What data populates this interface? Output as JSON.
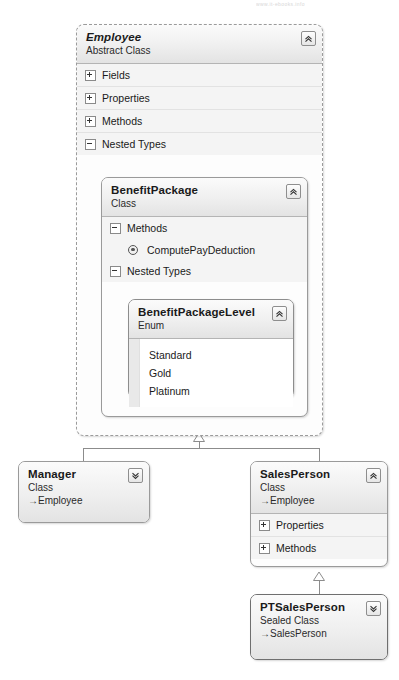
{
  "diagram": {
    "watermark": "www.it-ebooks.info",
    "type": "uml-class-diagram",
    "accent_border": "#9a9a9a",
    "header_gradient_top": "#fbfbfb",
    "header_gradient_bottom": "#e3e3e3",
    "compartment_bg": "#f4f4f4"
  },
  "employee": {
    "name": "Employee",
    "kind": "Abstract Class",
    "collapse_icon": "chevron-double-up-icon",
    "sections": [
      {
        "label": "Fields",
        "state": "collapsed",
        "toggle": "plus"
      },
      {
        "label": "Properties",
        "state": "collapsed",
        "toggle": "plus"
      },
      {
        "label": "Methods",
        "state": "collapsed",
        "toggle": "plus"
      },
      {
        "label": "Nested Types",
        "state": "expanded",
        "toggle": "minus"
      }
    ]
  },
  "benefit_package": {
    "name": "BenefitPackage",
    "kind": "Class",
    "collapse_icon": "chevron-double-up-icon",
    "sections": [
      {
        "label": "Methods",
        "state": "expanded",
        "toggle": "minus"
      },
      {
        "label": "Nested Types",
        "state": "expanded",
        "toggle": "minus"
      }
    ],
    "methods": [
      {
        "name": "ComputePayDeduction",
        "icon": "method-icon"
      }
    ]
  },
  "benefit_package_level": {
    "name": "BenefitPackageLevel",
    "kind": "Enum",
    "collapse_icon": "chevron-double-up-icon",
    "values": [
      "Standard",
      "Gold",
      "Platinum"
    ]
  },
  "manager": {
    "name": "Manager",
    "kind": "Class",
    "base": "Employee",
    "base_arrow": "→",
    "collapse_icon": "chevron-double-down-icon"
  },
  "sales_person": {
    "name": "SalesPerson",
    "kind": "Class",
    "base": "Employee",
    "base_arrow": "→",
    "collapse_icon": "chevron-double-up-icon",
    "sections": [
      {
        "label": "Properties",
        "state": "collapsed",
        "toggle": "plus"
      },
      {
        "label": "Methods",
        "state": "collapsed",
        "toggle": "plus"
      }
    ]
  },
  "pt_sales_person": {
    "name": "PTSalesPerson",
    "kind": "Sealed Class",
    "base": "SalesPerson",
    "base_arrow": "→",
    "collapse_icon": "chevron-double-down-icon"
  },
  "relationships": [
    {
      "from": "Manager",
      "to": "Employee",
      "type": "inheritance"
    },
    {
      "from": "SalesPerson",
      "to": "Employee",
      "type": "inheritance"
    },
    {
      "from": "PTSalesPerson",
      "to": "SalesPerson",
      "type": "inheritance"
    }
  ]
}
